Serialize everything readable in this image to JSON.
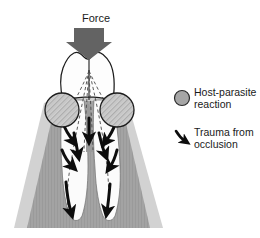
{
  "figure": {
    "title_label": "Force",
    "colors": {
      "background": "#ffffff",
      "gingiva_light": "#d2d2d2",
      "bone_mid": "#a8a8a8",
      "bone_dark": "#8f8f8f",
      "tooth_white": "#fdfdfd",
      "outline": "#1a1a1a",
      "force_arrow": "#636363",
      "legend_circle_fill": "#a6a6a6",
      "pulp_gray": "#9a9a9a"
    }
  },
  "diagram": {
    "force_arrow_name": "force-arrow",
    "tooth_crown_name": "tooth-crown",
    "root_left_name": "tooth-root-left",
    "root_right_name": "tooth-root-right",
    "gingiva_name": "gingiva",
    "alveolar_bone_name": "alveolar-bone",
    "hatched_circle_left": "host-parasite-circle-left",
    "hatched_circle_right": "host-parasite-circle-right",
    "dashed_force_lines": "force-distribution-lines",
    "trauma_arrows": "trauma-arrows"
  },
  "legend": {
    "items": [
      {
        "icon": "gray-circle-icon",
        "line1": "Host-parasite",
        "line2": "reaction"
      },
      {
        "icon": "curved-arrow-icon",
        "line1": "Trauma from",
        "line2": "occlusion"
      }
    ]
  }
}
